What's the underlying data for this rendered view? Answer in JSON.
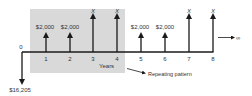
{
  "diagram": {
    "type": "cash-flow-timeline",
    "colors": {
      "shade": "#d9d9d9",
      "line": "#1a1a1a",
      "text": "#333333",
      "background": "#ffffff"
    },
    "origin": {
      "period_label": "0",
      "outflow_label": "$16,205"
    },
    "periods": [
      {
        "period": "1",
        "amount": "$2,000",
        "kind": "small"
      },
      {
        "period": "2",
        "amount": "$2,000",
        "kind": "small"
      },
      {
        "period": "3",
        "amount": "X",
        "kind": "large"
      },
      {
        "period": "4",
        "amount": "X",
        "kind": "large"
      },
      {
        "period": "5",
        "amount": "$2,000",
        "kind": "small"
      },
      {
        "period": "6",
        "amount": "$2,000",
        "kind": "small"
      },
      {
        "period": "7",
        "amount": "X",
        "kind": "large"
      },
      {
        "period": "8",
        "amount": "X",
        "kind": "large"
      }
    ],
    "axis_label": "Years",
    "annotation": "Repeating pattern",
    "continuation_symbol": "∞"
  }
}
